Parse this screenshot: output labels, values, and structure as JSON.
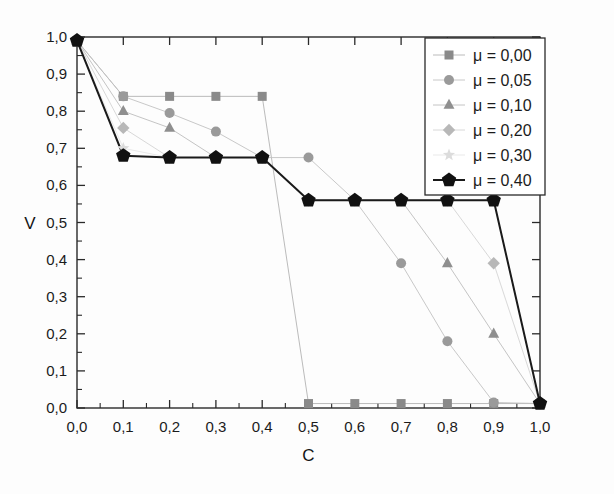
{
  "chart_data": {
    "type": "line",
    "title": "",
    "subtitle": "",
    "xlabel": "C",
    "ylabel": "V",
    "xlim": [
      0.0,
      1.0
    ],
    "ylim": [
      0.0,
      1.0
    ],
    "grid": false,
    "legend_position": "top-right",
    "x": [
      0.0,
      0.1,
      0.2,
      0.3,
      0.4,
      0.5,
      0.6,
      0.7,
      0.8,
      0.9,
      1.0
    ],
    "x_tick_labels": [
      "0,0",
      "0,1",
      "0,2",
      "0,3",
      "0,4",
      "0,5",
      "0,6",
      "0,7",
      "0,8",
      "0,9",
      "1,0"
    ],
    "y_tick_labels": [
      "0,0",
      "0,1",
      "0,2",
      "0,3",
      "0,4",
      "0,5",
      "0,6",
      "0,7",
      "0,8",
      "0,9",
      "1,0"
    ],
    "y_ticks": [
      0.0,
      0.1,
      0.2,
      0.3,
      0.4,
      0.5,
      0.6,
      0.7,
      0.8,
      0.9,
      1.0
    ],
    "series": [
      {
        "name": "μ = 0,00",
        "marker": "square",
        "color": "#8a8a8a",
        "line_color": "#b3b3b3",
        "values": [
          0.99,
          0.84,
          0.84,
          0.84,
          0.84,
          0.012,
          0.012,
          0.012,
          0.012,
          0.012,
          0.012
        ]
      },
      {
        "name": "μ = 0,05",
        "marker": "circle",
        "color": "#9a9a9a",
        "line_color": "#c2c2c2",
        "values": [
          0.99,
          0.84,
          0.795,
          0.745,
          0.675,
          0.675,
          0.56,
          0.39,
          0.18,
          0.015,
          0.012
        ]
      },
      {
        "name": "μ = 0,10",
        "marker": "triangle",
        "color": "#8f8f8f",
        "line_color": "#bdbdbd",
        "values": [
          0.99,
          0.8,
          0.755,
          0.675,
          0.675,
          0.56,
          0.56,
          0.56,
          0.39,
          0.2,
          0.012
        ]
      },
      {
        "name": "μ = 0,20",
        "marker": "diamond",
        "color": "#b8b8b8",
        "line_color": "#d4d4d4",
        "values": [
          0.99,
          0.755,
          0.675,
          0.675,
          0.675,
          0.56,
          0.56,
          0.56,
          0.56,
          0.39,
          0.012
        ]
      },
      {
        "name": "μ = 0,30",
        "marker": "star",
        "color": "#dcdcdc",
        "line_color": "#e6e6e6",
        "values": [
          0.99,
          0.7,
          0.675,
          0.675,
          0.675,
          0.56,
          0.56,
          0.56,
          0.56,
          0.56,
          0.012
        ]
      },
      {
        "name": "μ = 0,40",
        "marker": "pentagon",
        "color": "#111111",
        "line_color": "#1a1a1a",
        "values": [
          0.99,
          0.68,
          0.675,
          0.675,
          0.675,
          0.56,
          0.56,
          0.56,
          0.56,
          0.56,
          0.012
        ]
      }
    ]
  },
  "legend": {
    "entries": [
      {
        "label": "μ = 0,00"
      },
      {
        "label": "μ = 0,05"
      },
      {
        "label": "μ = 0,10"
      },
      {
        "label": "μ = 0,20"
      },
      {
        "label": "μ = 0,30"
      },
      {
        "label": "μ = 0,40"
      }
    ]
  },
  "axes": {
    "x_title": "C",
    "y_title": "V"
  }
}
